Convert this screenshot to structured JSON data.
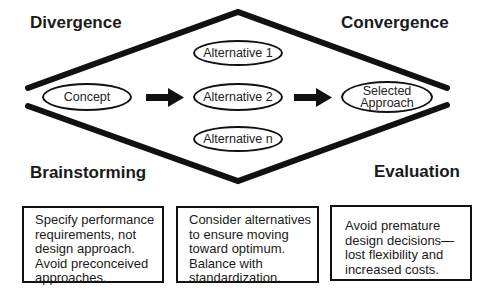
{
  "headings": {
    "divergence": "Divergence",
    "convergence": "Convergence",
    "brainstorming": "Brainstorming",
    "evaluation": "Evaluation"
  },
  "nodes": {
    "concept": "Concept",
    "alternative_1": "Alternative 1",
    "alternative_2": "Alternative 2",
    "alternative_n": "Alternative n",
    "selected_line1": "Selected",
    "selected_line2": "Approach"
  },
  "boxes": [
    {
      "lines": [
        "Specify performance",
        "requirements, not",
        "design approach.",
        "Avoid preconceived",
        "approaches."
      ]
    },
    {
      "lines": [
        "Consider alternatives",
        "to ensure moving",
        "toward optimum.",
        "Balance with",
        "standardization."
      ]
    },
    {
      "lines": [
        "Avoid premature",
        "design decisions—",
        "lost flexibility and",
        "increased costs."
      ]
    }
  ],
  "colors": {
    "stroke": "#111111",
    "background": "#ffffff"
  }
}
